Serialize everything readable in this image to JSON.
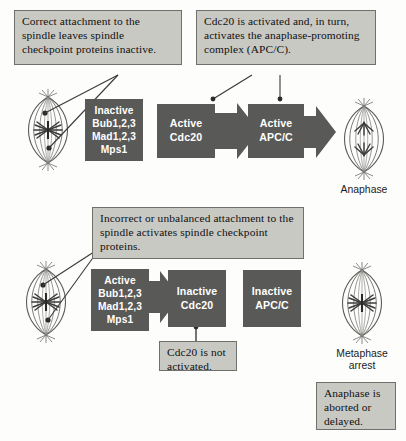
{
  "figure": {
    "title_present": false,
    "background_color": "#fdfdfc",
    "process_box_color": "#595957",
    "callout_box_color": "#c9c9c4",
    "callout_border_color": "#6f6f6b",
    "process_text_color": "#ffffff",
    "line_color": "#3a3a38"
  },
  "callouts": {
    "correct_attachment": "Correct attachment to the spindle leaves spindle checkpoint proteins inactive.",
    "cdc20_activated": "Cdc20 is activated and, in turn, activates the anaphase-promoting complex (APC/C).",
    "incorrect_attachment": "Incorrect or unbalanced attachment to the spindle activates spindle checkpoint proteins.",
    "cdc20_not_activated": "Cdc20 is not activated.",
    "anaphase_aborted": "Anaphase is aborted or delayed."
  },
  "row_top": {
    "checkpoint_proteins": "Inactive\nBub1,2,3\nMad1,2,3\nMps1",
    "checkpoint_proteins_lines": [
      "Inactive",
      "Bub1,2,3",
      "Mad1,2,3",
      "Mps1"
    ],
    "cdc20": "Active\nCdc20",
    "cdc20_lines": [
      "Active",
      "Cdc20"
    ],
    "apc": "Active\nAPC/C",
    "apc_lines": [
      "Active",
      "APC/C"
    ],
    "outcome_caption": "Anaphase"
  },
  "row_bottom": {
    "checkpoint_proteins": "Active\nBub1,2,3\nMad1,2,3\nMps1",
    "checkpoint_proteins_lines": [
      "Active",
      "Bub1,2,3",
      "Mad1,2,3",
      "Mps1"
    ],
    "cdc20": "Inactive\nCdc20",
    "cdc20_lines": [
      "Inactive",
      "Cdc20"
    ],
    "apc": "Inactive\nAPC/C",
    "apc_lines": [
      "Inactive",
      "APC/C"
    ],
    "outcome_caption": "Metaphase\narrest",
    "outcome_caption_lines": [
      "Metaphase",
      "arrest"
    ]
  },
  "spindles": {
    "top_left_state": "mitotic-spindle-attached",
    "top_right_state": "anaphase-spindle",
    "bottom_left_state": "mitotic-spindle-misattached",
    "bottom_right_state": "metaphase-spindle"
  },
  "arrows": {
    "top_cdc20_to_apc": "block-arrow-right",
    "top_apc_to_anaphase": "block-arrow-right",
    "bottom_proteins_to_cdc20": "block-arrow-right"
  }
}
